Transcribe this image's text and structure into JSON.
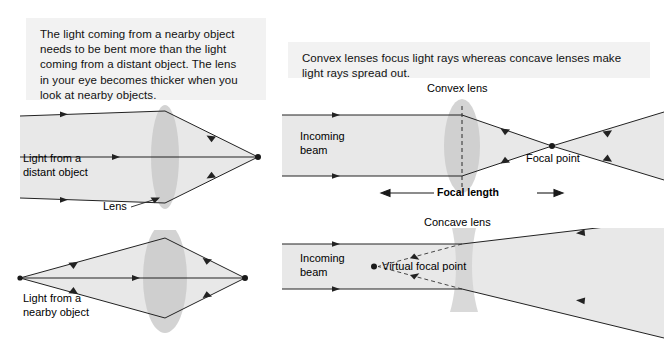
{
  "figure": {
    "title_hidden": "",
    "background_color": "#ffffff",
    "caption_bg": "#f2f2f2",
    "beam_fill": "#e8e8e8",
    "lens_fill": "#c9c9c9",
    "ray_color": "#222222"
  },
  "left_panel": {
    "caption": "The light coming from a nearby object\nneeds to be bent more than the light\ncoming from a distant object. The lens\nin your eye becomes thicker when you\nlook at nearby objects.",
    "top_diagram": {
      "name": "distant-object-lens-diagram",
      "beam_label": "Light from a\ndistant object",
      "lens_label": "Lens"
    },
    "bottom_diagram": {
      "name": "nearby-object-lens-diagram",
      "beam_label": "Light from a\nnearby object"
    }
  },
  "right_panel": {
    "caption": "Convex lenses focus light rays whereas concave lenses make\nlight rays spread out.",
    "top_diagram": {
      "name": "convex-lens-diagram",
      "lens_label": "Convex lens",
      "beam_label": "Incoming\nbeam",
      "focal_point_label": "Focal point",
      "focal_length_label": "Focal length"
    },
    "bottom_diagram": {
      "name": "concave-lens-diagram",
      "lens_label": "Concave lens",
      "beam_label": "Incoming\nbeam",
      "virtual_focal_point_label": "Virtual focal point"
    }
  }
}
